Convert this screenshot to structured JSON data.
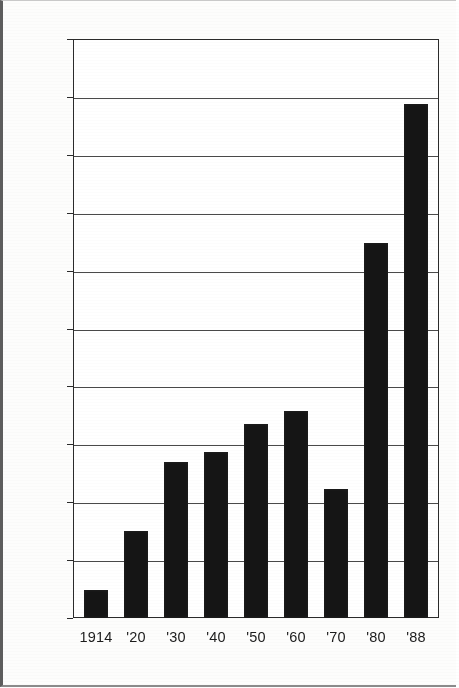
{
  "chart_data": {
    "type": "bar",
    "title": "",
    "subtitle": "",
    "xlabel": "",
    "ylabel": "",
    "categories": [
      "1914",
      "'20",
      "'30",
      "'40",
      "'50",
      "'60",
      "'70",
      "'80",
      "'88"
    ],
    "values": [
      34,
      105,
      189,
      201,
      235,
      250,
      156,
      453,
      622
    ],
    "ylim": [
      0,
      700
    ],
    "ytick_step": 70,
    "yticks": [
      0,
      70,
      140,
      210,
      280,
      350,
      420,
      490,
      560,
      630,
      700
    ],
    "ytick_labels": [
      "0",
      "70",
      "140",
      "210",
      "280",
      "350",
      "420",
      "490",
      "560",
      "630",
      "700"
    ],
    "grid": true,
    "grid_axis": "y",
    "legend": false,
    "legend_position": "none",
    "bar_color": "#151515",
    "grid_color": "#4a4a4a",
    "frame_color": "#2b2b2b",
    "background_color": "#ffffff",
    "series": [
      {
        "name": "series-1",
        "values": [
          34,
          105,
          189,
          201,
          235,
          250,
          156,
          453,
          622
        ]
      }
    ],
    "points": [
      {
        "category": "1914",
        "value": 34
      },
      {
        "category": "'20",
        "value": 105
      },
      {
        "category": "'30",
        "value": 189
      },
      {
        "category": "'40",
        "value": 201
      },
      {
        "category": "'50",
        "value": 235
      },
      {
        "category": "'60",
        "value": 250
      },
      {
        "category": "'70",
        "value": 156
      },
      {
        "category": "'80",
        "value": 453
      },
      {
        "category": "'88",
        "value": 622
      }
    ]
  }
}
